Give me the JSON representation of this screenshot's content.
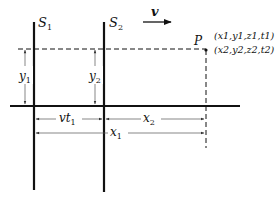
{
  "diagram": {
    "frames": [
      {
        "name": "S",
        "sub": "1",
        "x": 34
      },
      {
        "name": "S",
        "sub": "2",
        "x": 104
      }
    ],
    "velocity": {
      "label": "v"
    },
    "point": {
      "label": "P",
      "coords1": "(x1,y1,z1,t1)",
      "coords2": "(x2,y2,z2,t2)"
    },
    "dimensions": {
      "y1": {
        "var": "y",
        "sub": "1"
      },
      "y2": {
        "var": "y",
        "sub": "2"
      },
      "vt1": {
        "var": "vt",
        "sub": "1"
      },
      "x2": {
        "var": "x",
        "sub": "2"
      },
      "x1": {
        "var": "x",
        "sub": "1"
      }
    },
    "colors": {
      "ink": "#111111",
      "dim": "#555555",
      "background": "#ffffff"
    }
  }
}
